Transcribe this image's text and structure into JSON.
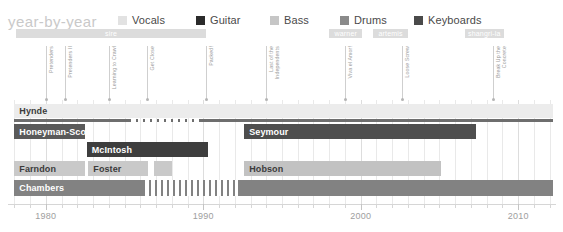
{
  "title": "year-by-year",
  "legend": [
    {
      "label": "Vocals",
      "color": "#e2e2e2",
      "x": 0
    },
    {
      "label": "Guitar",
      "color": "#2b2b2b",
      "x": 78
    },
    {
      "label": "Bass",
      "color": "#c6c6c6",
      "x": 152
    },
    {
      "label": "Drums",
      "color": "#8a8a8a",
      "x": 222
    },
    {
      "label": "Keyboards",
      "color": "#4a4a4a",
      "x": 296
    }
  ],
  "axis": {
    "ticks": [
      1978,
      1979,
      1980,
      1981,
      1982,
      1983,
      1984,
      1985,
      1986,
      1987,
      1988,
      1989,
      1990,
      1991,
      1992,
      1993,
      1994,
      1995,
      1996,
      1997,
      1998,
      1999,
      2000,
      2001,
      2002,
      2003,
      2004,
      2005,
      2006,
      2007,
      2008,
      2009,
      2010,
      2011,
      2012
    ],
    "major_labels": [
      "1980",
      "1990",
      "2000",
      "2010"
    ],
    "range": [
      1977.6,
      2012.4
    ]
  },
  "labels_row": [
    {
      "name": "sire",
      "start": 1978.1,
      "end": 1990.2,
      "color": "#dcdcdc"
    },
    {
      "name": "warner",
      "start": 1998.0,
      "end": 2000.1,
      "color": "#dcdcdc"
    },
    {
      "name": "artemis",
      "start": 2000.8,
      "end": 2003.0,
      "color": "#dcdcdc"
    },
    {
      "name": "shangri-la",
      "start": 2006.6,
      "end": 2009.1,
      "color": "#dcdcdc"
    }
  ],
  "albums": [
    {
      "title": "Pretenders",
      "year": 1980.0,
      "lines": [
        "Pretenders"
      ]
    },
    {
      "title": "Pretenders II",
      "year": 1981.2,
      "lines": [
        "Pretenders II"
      ]
    },
    {
      "title": "Learning to Crawl",
      "year": 1984.0,
      "lines": [
        "Learning to Crawl"
      ]
    },
    {
      "title": "Get Close",
      "year": 1986.4,
      "lines": [
        "Get Close"
      ]
    },
    {
      "title": "Packed!",
      "year": 1990.2,
      "lines": [
        "Packed!"
      ]
    },
    {
      "title": "Last of the Independents",
      "year": 1994.0,
      "lines": [
        "Last of the",
        "Independents"
      ]
    },
    {
      "title": "Viva el Amor!",
      "year": 1999.0,
      "lines": [
        "Viva el Amor!"
      ]
    },
    {
      "title": "Loose Screw",
      "year": 2002.6,
      "lines": [
        "Loose Screw"
      ]
    },
    {
      "title": "Break Up the Concrete",
      "year": 2008.4,
      "lines": [
        "Break Up the",
        "Concrete"
      ]
    }
  ],
  "rows": [
    {
      "member": "Hynde",
      "instrument": "Vocals",
      "name_inside": false,
      "name_color": "#3b3b3b",
      "bars": [
        {
          "start": 1978.0,
          "end": 2012.2,
          "color": "#ececec",
          "top": 104,
          "height": 14
        }
      ],
      "lines": [
        {
          "start": 1978.0,
          "end": 1985.3,
          "color": "#6e6e6e",
          "top": 119,
          "height": 2.5,
          "style": "solid"
        },
        {
          "start": 1985.3,
          "end": 1989.8,
          "color": "#6e6e6e",
          "top": 119,
          "height": 2.5,
          "style": "dashed"
        },
        {
          "start": 1989.8,
          "end": 2012.2,
          "color": "#6e6e6e",
          "top": 119,
          "height": 2.5,
          "style": "solid"
        }
      ]
    },
    {
      "member": "Honeyman-Scott",
      "instrument": "Guitar",
      "name_inside": true,
      "name_color": "#ffffff",
      "bars": [
        {
          "start": 1978.0,
          "end": 1982.5,
          "color": "#5a5a5a",
          "top": 124,
          "height": 15
        }
      ],
      "lines": []
    },
    {
      "member": "Seymour",
      "instrument": "Guitar",
      "name_inside": true,
      "name_color": "#ffffff",
      "bars": [
        {
          "start": 1992.6,
          "end": 2007.3,
          "color": "#4e4e4e",
          "top": 124,
          "height": 15
        }
      ],
      "lines": []
    },
    {
      "member": "McIntosh",
      "instrument": "Guitar",
      "name_inside": true,
      "name_color": "#ffffff",
      "bars": [
        {
          "start": 1982.6,
          "end": 1990.3,
          "color": "#3e3e3e",
          "top": 142,
          "height": 15
        }
      ],
      "lines": []
    },
    {
      "member": "Farndon",
      "instrument": "Bass",
      "name_inside": true,
      "name_color": "#3b3b3b",
      "bars": [
        {
          "start": 1978.0,
          "end": 1982.5,
          "color": "#c9c9c9",
          "top": 161,
          "height": 15
        }
      ],
      "lines": []
    },
    {
      "member": "Foster",
      "instrument": "Bass",
      "name_inside": true,
      "name_color": "#3b3b3b",
      "bars": [
        {
          "start": 1982.7,
          "end": 1986.5,
          "color": "#c9c9c9",
          "top": 161,
          "height": 15
        },
        {
          "start": 1986.9,
          "end": 1988.0,
          "color": "#c9c9c9",
          "top": 161,
          "height": 15
        }
      ],
      "lines": []
    },
    {
      "member": "Hobson",
      "instrument": "Bass",
      "name_inside": true,
      "name_color": "#3b3b3b",
      "bars": [
        {
          "start": 1992.6,
          "end": 2005.1,
          "color": "#c2c2c2",
          "top": 161,
          "height": 15
        }
      ],
      "lines": []
    },
    {
      "member": "Chambers",
      "instrument": "Drums",
      "name_inside": true,
      "name_color": "#ffffff",
      "bars": [
        {
          "start": 1978.0,
          "end": 1986.2,
          "color": "#828282",
          "top": 180,
          "height": 16
        },
        {
          "start": 1992.2,
          "end": 2012.2,
          "color": "#828282",
          "top": 180,
          "height": 16
        }
      ],
      "lines": [],
      "striped": [
        {
          "start": 1986.2,
          "end": 1992.2,
          "color": "#828282",
          "top": 180,
          "height": 16
        }
      ]
    }
  ]
}
